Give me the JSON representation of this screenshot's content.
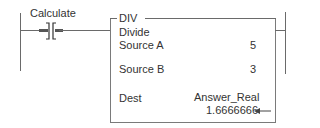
{
  "rung": {
    "contact": {
      "label": "Calculate",
      "type": "examine-if-open"
    },
    "instruction": {
      "mnemonic": "DIV",
      "description": "Divide",
      "operands": [
        {
          "name": "Source A",
          "value": "5"
        },
        {
          "name": "Source B",
          "value": "3"
        },
        {
          "name": "Dest",
          "tag": "Answer_Real",
          "value": "1.6666666"
        }
      ],
      "result_arrow": "←"
    }
  },
  "colors": {
    "lines": "#6a6a6a",
    "text": "#333333",
    "contact_highlight": "#555555"
  }
}
